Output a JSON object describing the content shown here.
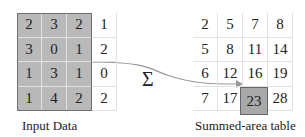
{
  "input": {
    "label": "Input Data",
    "rows": [
      [
        "2",
        "3",
        "2",
        "1"
      ],
      [
        "3",
        "0",
        "1",
        "2"
      ],
      [
        "1",
        "3",
        "1",
        "0"
      ],
      [
        "1",
        "4",
        "2",
        "2"
      ]
    ],
    "shaded_cols": 3
  },
  "operator": {
    "symbol": "Σ"
  },
  "output": {
    "label": "Summed-area table",
    "rows": [
      [
        "2",
        "5",
        "7",
        "8"
      ],
      [
        "5",
        "8",
        "11",
        "14"
      ],
      [
        "6",
        "12",
        "16",
        "19"
      ],
      [
        "7",
        "17",
        "23",
        "28"
      ]
    ],
    "highlight": {
      "row": 3,
      "col": 2,
      "value": "23"
    }
  },
  "colors": {
    "shade": "#b9b9b9",
    "highlight": "#a9a9a9",
    "arrow": "#9a9a9a"
  }
}
